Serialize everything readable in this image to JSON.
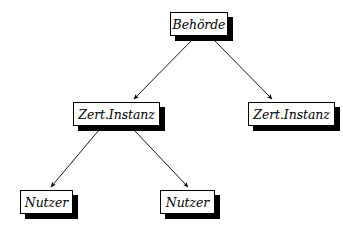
{
  "diagram": {
    "background_color": "#ffffff",
    "line_color": "#000000",
    "box_fill_color": "#ffffff",
    "box_border_color": "#000000",
    "shadow_color": "#000000",
    "nodes": [
      {
        "id": "behoerde",
        "label": "Behörde",
        "x": 170,
        "y": 12,
        "w": 58,
        "h": 24,
        "font_size": 12.5
      },
      {
        "id": "zert-instanz-left",
        "label": "Zert.Instanz",
        "x": 73,
        "y": 102,
        "w": 87,
        "h": 24,
        "font_size": 12.5
      },
      {
        "id": "zert-instanz-right",
        "label": "Zert.Instanz",
        "x": 248,
        "y": 102,
        "w": 87,
        "h": 24,
        "font_size": 12.5
      },
      {
        "id": "nutzer-left",
        "label": "Nutzer",
        "x": 20,
        "y": 190,
        "w": 53,
        "h": 24,
        "font_size": 12.5
      },
      {
        "id": "nutzer-middle",
        "label": "Nutzer",
        "x": 160,
        "y": 190,
        "w": 55,
        "h": 24,
        "font_size": 12.5
      }
    ],
    "edges": [
      {
        "id": "behoerde-to-zert-left",
        "from": "behoerde",
        "to": "zert-instanz-left",
        "x1": 192,
        "y1": 40,
        "x2": 134,
        "y2": 99
      },
      {
        "id": "behoerde-to-zert-right",
        "from": "behoerde",
        "to": "zert-instanz-right",
        "x1": 214,
        "y1": 40,
        "x2": 272,
        "y2": 99
      },
      {
        "id": "zert-left-to-nutzer-left",
        "from": "zert-instanz-left",
        "to": "nutzer-left",
        "x1": 99,
        "y1": 130,
        "x2": 51,
        "y2": 187
      },
      {
        "id": "zert-left-to-nutzer-middle",
        "from": "zert-instanz-left",
        "to": "nutzer-middle",
        "x1": 134,
        "y1": 130,
        "x2": 188,
        "y2": 187
      }
    ]
  }
}
